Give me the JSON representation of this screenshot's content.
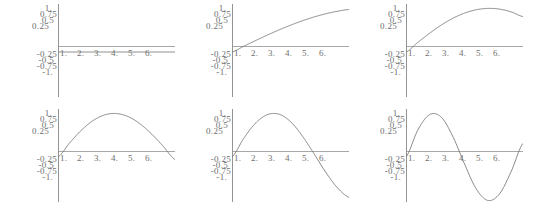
{
  "figure": {
    "title": "",
    "rows": 2,
    "cols": 3,
    "background": "#ffffff",
    "axis_color": "#a8a8a8",
    "curve_color": "#787878",
    "label_color": "#6e6e6e"
  },
  "axes": {
    "y_tick_labels": [
      "1.",
      "0.75",
      "0.5",
      "0.25",
      "-0.25",
      "-0.5",
      "-0.75",
      "-1."
    ],
    "x_tick_labels": [
      "1.",
      "2.",
      "3.",
      "4.",
      "5.",
      "6."
    ],
    "xlim": [
      0,
      6.6
    ],
    "ylim": [
      -1.1,
      1.1
    ]
  },
  "chart_data": [
    {
      "type": "line",
      "title": "",
      "xlabel": "",
      "ylabel": "",
      "xlim": [
        0,
        6.6
      ],
      "ylim": [
        -1.1,
        1.1
      ],
      "grid": false,
      "legend": "none",
      "x": [
        0,
        0.66,
        1.32,
        1.98,
        2.64,
        3.3,
        3.96,
        4.62,
        5.28,
        5.94,
        6.6
      ],
      "series": [
        {
          "name": "Sin[0 x]",
          "values": [
            0,
            0,
            0,
            0,
            0,
            0,
            0,
            0,
            0,
            0,
            0
          ]
        }
      ]
    },
    {
      "type": "line",
      "title": "",
      "xlabel": "",
      "ylabel": "",
      "xlim": [
        0,
        6.6
      ],
      "ylim": [
        -1.1,
        1.1
      ],
      "grid": false,
      "legend": "none",
      "x": [
        0,
        0.66,
        1.32,
        1.98,
        2.64,
        3.3,
        3.96,
        4.62,
        5.28,
        5.94,
        6.6
      ],
      "series": [
        {
          "name": "Sin[x/5]",
          "values": [
            0,
            0.131,
            0.26,
            0.385,
            0.504,
            0.614,
            0.714,
            0.802,
            0.875,
            0.933,
            0.974
          ]
        }
      ]
    },
    {
      "type": "line",
      "title": "",
      "xlabel": "",
      "ylabel": "",
      "xlim": [
        0,
        6.6
      ],
      "ylim": [
        -1.1,
        1.1
      ],
      "grid": false,
      "legend": "none",
      "x": [
        0,
        0.66,
        1.32,
        1.98,
        2.64,
        3.3,
        3.96,
        4.62,
        5.28,
        5.94,
        6.6
      ],
      "series": [
        {
          "name": "Sin[x/3]",
          "values": [
            0,
            0.218,
            0.426,
            0.614,
            0.772,
            0.891,
            0.968,
            0.999,
            0.982,
            0.918,
            0.811
          ]
        }
      ]
    },
    {
      "type": "line",
      "title": "",
      "xlabel": "",
      "ylabel": "",
      "xlim": [
        0,
        6.6
      ],
      "ylim": [
        -1.1,
        1.1
      ],
      "grid": false,
      "legend": "none",
      "x": [
        0,
        0.66,
        1.32,
        1.98,
        2.64,
        3.3,
        3.96,
        4.62,
        5.28,
        5.94,
        6.6
      ],
      "series": [
        {
          "name": "Sin[x/2]",
          "values": [
            0,
            0.324,
            0.614,
            0.835,
            0.966,
            0.996,
            0.925,
            0.762,
            0.527,
            0.243,
            -0.058
          ]
        }
      ]
    },
    {
      "type": "line",
      "title": "",
      "xlabel": "",
      "ylabel": "",
      "xlim": [
        0,
        6.6
      ],
      "ylim": [
        -1.1,
        1.1
      ],
      "grid": false,
      "legend": "none",
      "x": [
        0,
        0.66,
        1.32,
        1.98,
        2.64,
        3.3,
        3.96,
        4.62,
        5.28,
        5.94,
        6.6
      ],
      "series": [
        {
          "name": "Sin[2 x/3]",
          "values": [
            0,
            0.426,
            0.772,
            0.968,
            0.982,
            0.811,
            0.486,
            0.078,
            -0.344,
            -0.701,
            -0.925
          ]
        }
      ]
    },
    {
      "type": "line",
      "title": "",
      "xlabel": "",
      "ylabel": "",
      "xlim": [
        0,
        6.6
      ],
      "ylim": [
        -1.1,
        1.1
      ],
      "grid": false,
      "legend": "none",
      "x": [
        0,
        0.66,
        1.32,
        1.98,
        2.64,
        3.3,
        3.96,
        4.62,
        5.28,
        5.94,
        6.6
      ],
      "series": [
        {
          "name": "Sin[x]",
          "values": [
            0,
            0.613,
            0.969,
            0.917,
            0.472,
            -0.158,
            -0.729,
            -0.996,
            -0.842,
            -0.325,
            0.312
          ]
        }
      ]
    }
  ]
}
